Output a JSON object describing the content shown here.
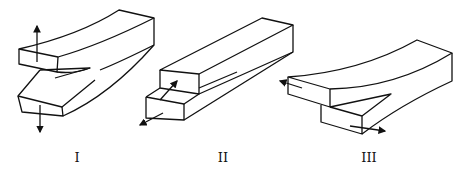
{
  "diagram": {
    "modes": [
      {
        "id": "mode-1",
        "label": "I",
        "description": "opening mode (tension normal to crack plane)"
      },
      {
        "id": "mode-2",
        "label": "II",
        "description": "sliding mode (in-plane shear)"
      },
      {
        "id": "mode-3",
        "label": "III",
        "description": "tearing mode (out-of-plane shear)"
      }
    ],
    "colors": {
      "line": "#111111",
      "background": "#ffffff"
    }
  }
}
